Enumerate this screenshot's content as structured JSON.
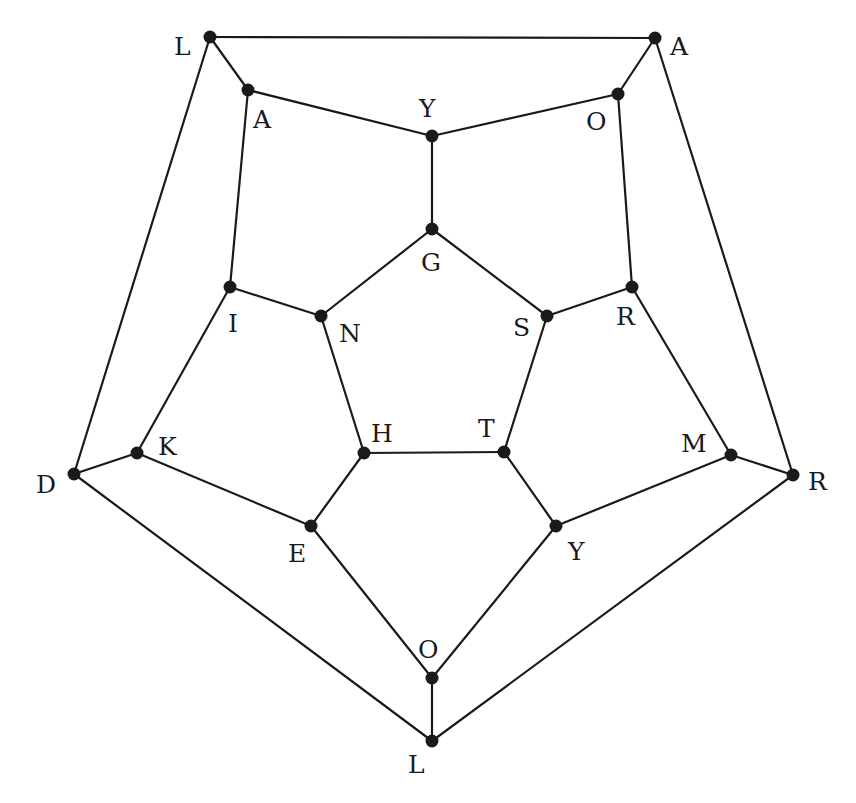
{
  "diagram": {
    "type": "graph",
    "colors": {
      "edge": "#1a1a1a",
      "node": "#1a1a1a",
      "label": "#1a1a1a",
      "background": "#ffffff"
    },
    "nodes": [
      {
        "id": "n0",
        "label": "L",
        "x": 210,
        "y": 37,
        "lx": 174,
        "ly": 55
      },
      {
        "id": "n1",
        "label": "A",
        "x": 655,
        "y": 38,
        "lx": 670,
        "ly": 55
      },
      {
        "id": "n2",
        "label": "R",
        "x": 793,
        "y": 475,
        "lx": 808,
        "ly": 490
      },
      {
        "id": "n3",
        "label": "L",
        "x": 432,
        "y": 741,
        "lx": 408,
        "ly": 773
      },
      {
        "id": "n4",
        "label": "D",
        "x": 74,
        "y": 474,
        "lx": 36,
        "ly": 493
      },
      {
        "id": "n5",
        "label": "A",
        "x": 248,
        "y": 90,
        "lx": 253,
        "ly": 128
      },
      {
        "id": "n6",
        "label": "Y",
        "x": 432,
        "y": 136,
        "lx": 419,
        "ly": 117
      },
      {
        "id": "n7",
        "label": "O",
        "x": 618,
        "y": 94,
        "lx": 586,
        "ly": 130
      },
      {
        "id": "n8",
        "label": "R",
        "x": 632,
        "y": 287,
        "lx": 616,
        "ly": 325
      },
      {
        "id": "n9",
        "label": "M",
        "x": 731,
        "y": 455,
        "lx": 681,
        "ly": 452
      },
      {
        "id": "n10",
        "label": "Y",
        "x": 556,
        "y": 526,
        "lx": 568,
        "ly": 560
      },
      {
        "id": "n11",
        "label": "O",
        "x": 432,
        "y": 678,
        "lx": 418,
        "ly": 658
      },
      {
        "id": "n12",
        "label": "E",
        "x": 311,
        "y": 526,
        "lx": 288,
        "ly": 562
      },
      {
        "id": "n13",
        "label": "K",
        "x": 137,
        "y": 453,
        "lx": 158,
        "ly": 455
      },
      {
        "id": "n14",
        "label": "I",
        "x": 230,
        "y": 287,
        "lx": 228,
        "ly": 332
      },
      {
        "id": "n15",
        "label": "G",
        "x": 432,
        "y": 229,
        "lx": 421,
        "ly": 271
      },
      {
        "id": "n16",
        "label": "S",
        "x": 547,
        "y": 316,
        "lx": 513,
        "ly": 336
      },
      {
        "id": "n17",
        "label": "T",
        "x": 504,
        "y": 452,
        "lx": 478,
        "ly": 437
      },
      {
        "id": "n18",
        "label": "H",
        "x": 364,
        "y": 453,
        "lx": 371,
        "ly": 442
      },
      {
        "id": "n19",
        "label": "N",
        "x": 321,
        "y": 316,
        "lx": 339,
        "ly": 342
      }
    ],
    "edges": [
      [
        "n0",
        "n1"
      ],
      [
        "n1",
        "n2"
      ],
      [
        "n2",
        "n3"
      ],
      [
        "n3",
        "n4"
      ],
      [
        "n4",
        "n0"
      ],
      [
        "n0",
        "n5"
      ],
      [
        "n1",
        "n7"
      ],
      [
        "n2",
        "n9"
      ],
      [
        "n3",
        "n11"
      ],
      [
        "n4",
        "n13"
      ],
      [
        "n5",
        "n6"
      ],
      [
        "n6",
        "n7"
      ],
      [
        "n7",
        "n8"
      ],
      [
        "n8",
        "n9"
      ],
      [
        "n9",
        "n10"
      ],
      [
        "n10",
        "n11"
      ],
      [
        "n11",
        "n12"
      ],
      [
        "n12",
        "n13"
      ],
      [
        "n13",
        "n14"
      ],
      [
        "n14",
        "n5"
      ],
      [
        "n6",
        "n15"
      ],
      [
        "n8",
        "n16"
      ],
      [
        "n10",
        "n17"
      ],
      [
        "n12",
        "n18"
      ],
      [
        "n14",
        "n19"
      ],
      [
        "n15",
        "n16"
      ],
      [
        "n16",
        "n17"
      ],
      [
        "n17",
        "n18"
      ],
      [
        "n18",
        "n19"
      ],
      [
        "n19",
        "n15"
      ]
    ],
    "node_radius": 6.5
  }
}
